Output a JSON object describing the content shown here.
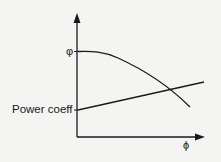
{
  "diagram": {
    "labels": {
      "y_curve_label": "φ",
      "x_axis_label": "ϕ",
      "line_label": "Power coeff"
    },
    "colors": {
      "background": "#f4f4f2",
      "ink": "#1a1a1a"
    },
    "curves": [
      {
        "name": "phi-curve",
        "shape": "descending concave curve"
      },
      {
        "name": "power-coeff-line",
        "shape": "rising straight line"
      }
    ]
  }
}
